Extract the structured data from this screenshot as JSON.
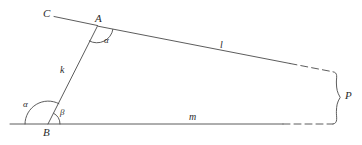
{
  "figure": {
    "type": "geometry-diagram",
    "stroke_color": "#4a4a4a",
    "label_color": "#2b2b2b",
    "background_color": "#ffffff",
    "canvas": {
      "width": 362,
      "height": 145
    }
  },
  "points": [
    {
      "id": "C",
      "label": "C",
      "x": 47,
      "y": 14
    },
    {
      "id": "A",
      "label": "A",
      "x": 99,
      "y": 19
    },
    {
      "id": "B",
      "label": "B",
      "x": 47,
      "y": 134
    }
  ],
  "segments": [
    {
      "id": "k",
      "label": "k",
      "label_x": 62,
      "label_y": 71,
      "from": "A",
      "to": "B",
      "x1": 97,
      "y1": 27,
      "x2": 48,
      "y2": 124,
      "dashed": false
    },
    {
      "id": "l",
      "label": "l",
      "label_x": 221,
      "label_y": 46,
      "from": "A",
      "to": "right",
      "x1": 97,
      "y1": 26,
      "x2": 335,
      "y2": 72,
      "dashed": false
    },
    {
      "id": "m",
      "label": "m",
      "label_x": 191,
      "label_y": 118,
      "from": "B",
      "to": "right",
      "x1": 10,
      "y1": 124,
      "x2": 334,
      "y2": 124,
      "dashed": false
    },
    {
      "id": "CA",
      "label": "",
      "from": "C",
      "to": "A",
      "x1": 54,
      "y1": 17,
      "x2": 97,
      "y2": 26,
      "dashed": false
    }
  ],
  "angles": [
    {
      "id": "alpha-at-A",
      "label": "α",
      "vertex": "A",
      "label_x": 106,
      "label_y": 40,
      "radius": 16
    },
    {
      "id": "alpha-at-B",
      "label": "α",
      "vertex": "B",
      "label_x": 25,
      "label_y": 104,
      "radius": 23
    },
    {
      "id": "beta-at-B",
      "label": "β",
      "vertex": "B",
      "label_x": 61,
      "label_y": 112,
      "radius": 12
    }
  ],
  "brace": {
    "label": "P",
    "label_x": 347,
    "label_y": 95,
    "top_y": 72,
    "bottom_y": 124,
    "x": 334
  }
}
